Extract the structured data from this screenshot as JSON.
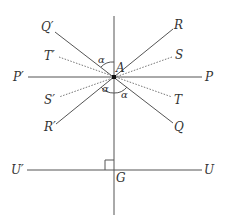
{
  "diagram": {
    "type": "geometry",
    "colors": {
      "line": "#555555",
      "dotted": "#777777",
      "text": "#333333",
      "point": "#111111"
    },
    "points": {
      "A": {
        "label": "A"
      },
      "G": {
        "label": "G"
      }
    },
    "labels": {
      "Q_prime": "Q′",
      "R": "R",
      "T_prime": "T′",
      "S": "S",
      "P_prime": "P′",
      "P": "P",
      "S_prime": "S′",
      "T": "T",
      "R_prime": "R′",
      "Q": "Q",
      "U_prime": "U′",
      "U": "U",
      "A": "A",
      "G": "G"
    },
    "angles": {
      "upper_left": "α",
      "lower_left": "α",
      "lower_right": "α"
    },
    "lines": [
      {
        "name": "P′P",
        "style": "solid"
      },
      {
        "name": "Q′Q",
        "style": "solid"
      },
      {
        "name": "RR′",
        "style": "solid"
      },
      {
        "name": "T′T",
        "style": "dotted"
      },
      {
        "name": "SS′",
        "style": "dotted"
      },
      {
        "name": "U′U",
        "style": "solid"
      },
      {
        "name": "vertical through A and G",
        "style": "solid"
      }
    ],
    "right_angle_at": "G"
  }
}
